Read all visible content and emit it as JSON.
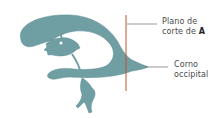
{
  "diagram": {
    "colors": {
      "ventricle_fill": "#6f9ea3",
      "ventricle_edge": "#5b8a90",
      "cut_plane_line": "#c0552a",
      "leader_line": "#555555",
      "background": "#ffffff"
    },
    "labels": {
      "cut_plane": {
        "line1": "Plano de",
        "line2_prefix": "corte de ",
        "line2_bold": "A"
      },
      "occipital_horn": {
        "line1": "Corno",
        "line2": "occipital"
      }
    }
  }
}
